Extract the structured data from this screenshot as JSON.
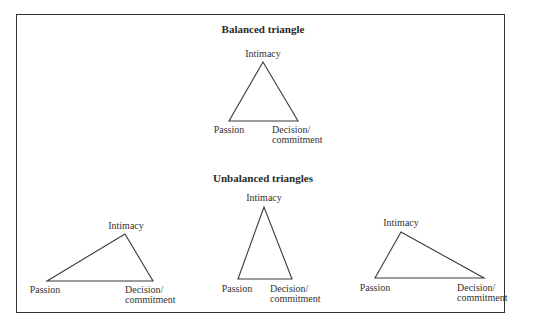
{
  "figure": {
    "sections": [
      {
        "title": "Balanced triangle",
        "triangles": [
          {
            "apex_label": "Intimacy",
            "left_label": "Passion",
            "right_label_line1": "Decision/",
            "right_label_line2": "commitment",
            "points": "263,62 229,121 298,121"
          }
        ]
      },
      {
        "title": "Unbalanced triangles",
        "triangles": [
          {
            "apex_label": "Intimacy",
            "left_label": "Passion",
            "right_label_line1": "Decision/",
            "right_label_line2": "commitment",
            "points": "125,234 47,281 153,281"
          },
          {
            "apex_label": "Intimacy",
            "left_label": "Passion",
            "right_label_line1": "Decision/",
            "right_label_line2": "commitment",
            "points": "264,207 238,279 292,279"
          },
          {
            "apex_label": "Intimacy",
            "left_label": "Passion",
            "right_label_line1": "Decision/",
            "right_label_line2": "commitment",
            "points": "401,232 375,278 484,278"
          }
        ]
      }
    ]
  }
}
